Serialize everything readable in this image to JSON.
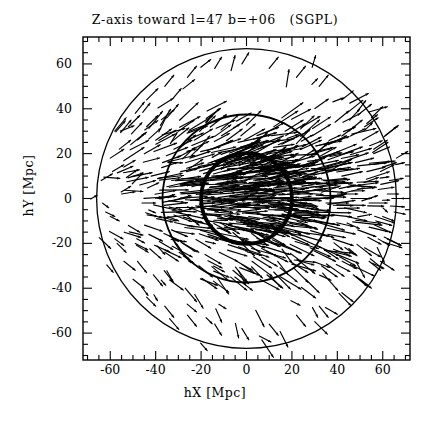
{
  "chart_data": {
    "type": "scatter",
    "title": "Z-axis toward l=47 b=+06   (SGPL)",
    "subtitle": "",
    "xlabel": "hX [Mpc]",
    "ylabel": "hY [Mpc]",
    "xlim": [
      -72,
      72
    ],
    "ylim": [
      -72,
      72
    ],
    "grid": false,
    "legend": null,
    "xticks": [
      -60,
      -40,
      -20,
      0,
      20,
      40,
      60
    ],
    "xticklabels": [
      "-60",
      "-40",
      "-20",
      "0",
      "20",
      "40",
      "60"
    ],
    "yticks": [
      60,
      40,
      20,
      0,
      -20,
      -40,
      -60
    ],
    "yticklabels": [
      "60",
      "40",
      "20",
      "0",
      "-20",
      "-40",
      "-60"
    ],
    "minor_tick_step": 5,
    "annotations": [
      {
        "kind": "circle",
        "center": [
          0,
          0
        ],
        "radius": 20,
        "linewidth": "thick",
        "label": "inner-circle-20Mpc"
      },
      {
        "kind": "circle",
        "center": [
          0,
          0
        ],
        "radius": 37,
        "linewidth": "medium",
        "label": "middle-circle-37Mpc"
      },
      {
        "kind": "circle",
        "center": [
          0,
          0
        ],
        "radius": 66,
        "linewidth": "thin",
        "label": "outer-circle-66Mpc"
      }
    ],
    "vectors": [
      [
        -64,
        8,
        5,
        3
      ],
      [
        -62,
        -6,
        4,
        -2
      ],
      [
        -60,
        18,
        6,
        4
      ],
      [
        -58,
        30,
        5,
        6
      ],
      [
        -57,
        -20,
        4,
        -4
      ],
      [
        -55,
        2,
        6,
        1
      ],
      [
        -54,
        14,
        5,
        3
      ],
      [
        -52,
        -12,
        5,
        -3
      ],
      [
        -51,
        24,
        6,
        5
      ],
      [
        -49,
        38,
        4,
        5
      ],
      [
        -48,
        -28,
        4,
        -5
      ],
      [
        -47,
        6,
        7,
        2
      ],
      [
        -46,
        -2,
        6,
        0
      ],
      [
        -45,
        20,
        7,
        4
      ],
      [
        -44,
        32,
        5,
        5
      ],
      [
        -43,
        -16,
        6,
        -3
      ],
      [
        -42,
        10,
        8,
        2
      ],
      [
        -41,
        -34,
        4,
        -5
      ],
      [
        -40,
        26,
        7,
        5
      ],
      [
        -39,
        0,
        8,
        1
      ],
      [
        -38,
        -8,
        7,
        -2
      ],
      [
        -37,
        16,
        8,
        3
      ],
      [
        -36,
        -24,
        6,
        -4
      ],
      [
        -35,
        36,
        5,
        6
      ],
      [
        -34,
        5,
        9,
        1
      ],
      [
        -33,
        -14,
        7,
        -3
      ],
      [
        -32,
        22,
        8,
        4
      ],
      [
        -31,
        -4,
        8,
        0
      ],
      [
        -30,
        30,
        7,
        5
      ],
      [
        -29,
        12,
        9,
        2
      ],
      [
        -28,
        -20,
        7,
        -4
      ],
      [
        -27,
        -40,
        5,
        -6
      ],
      [
        -26,
        2,
        10,
        1
      ],
      [
        -25,
        18,
        9,
        3
      ],
      [
        -24,
        -10,
        9,
        -2
      ],
      [
        -23,
        26,
        8,
        5
      ],
      [
        -22,
        8,
        10,
        2
      ],
      [
        -21,
        -30,
        6,
        -5
      ],
      [
        -20,
        -2,
        10,
        0
      ],
      [
        -19,
        14,
        10,
        3
      ],
      [
        -18,
        34,
        6,
        6
      ],
      [
        -17,
        -16,
        9,
        -3
      ],
      [
        -16,
        4,
        11,
        1
      ],
      [
        -15,
        22,
        9,
        4
      ],
      [
        -14,
        -6,
        11,
        -1
      ],
      [
        -13,
        10,
        11,
        2
      ],
      [
        -12,
        -24,
        8,
        -4
      ],
      [
        -11,
        28,
        8,
        5
      ],
      [
        -10,
        0,
        12,
        1
      ],
      [
        -9,
        16,
        11,
        3
      ],
      [
        -8,
        -12,
        11,
        -2
      ],
      [
        -7,
        6,
        12,
        1
      ],
      [
        -6,
        -32,
        7,
        -6
      ],
      [
        -5,
        20,
        10,
        4
      ],
      [
        -4,
        -2,
        12,
        0
      ],
      [
        -3,
        11,
        12,
        2
      ],
      [
        -2,
        -18,
        10,
        -4
      ],
      [
        -1,
        26,
        9,
        5
      ],
      [
        0,
        3,
        12,
        1
      ],
      [
        1,
        -8,
        12,
        -2
      ],
      [
        2,
        15,
        11,
        3
      ],
      [
        3,
        -26,
        8,
        -5
      ],
      [
        4,
        8,
        12,
        2
      ],
      [
        5,
        22,
        10,
        4
      ],
      [
        6,
        -14,
        11,
        -3
      ],
      [
        7,
        0,
        12,
        0
      ],
      [
        8,
        12,
        11,
        2
      ],
      [
        9,
        -34,
        7,
        -6
      ],
      [
        10,
        18,
        10,
        3
      ],
      [
        11,
        -4,
        12,
        -1
      ],
      [
        12,
        6,
        12,
        1
      ],
      [
        13,
        -20,
        10,
        -4
      ],
      [
        14,
        24,
        9,
        4
      ],
      [
        15,
        10,
        11,
        2
      ],
      [
        16,
        -10,
        11,
        -2
      ],
      [
        17,
        30,
        8,
        5
      ],
      [
        18,
        2,
        11,
        0
      ],
      [
        19,
        -28,
        8,
        -5
      ],
      [
        20,
        16,
        10,
        3
      ],
      [
        21,
        -6,
        11,
        -1
      ],
      [
        22,
        8,
        11,
        1
      ],
      [
        23,
        -16,
        10,
        -3
      ],
      [
        24,
        22,
        9,
        4
      ],
      [
        25,
        0,
        11,
        0
      ],
      [
        26,
        -36,
        6,
        -6
      ],
      [
        27,
        12,
        10,
        2
      ],
      [
        28,
        -22,
        9,
        -4
      ],
      [
        29,
        28,
        8,
        5
      ],
      [
        30,
        4,
        10,
        1
      ],
      [
        31,
        -10,
        10,
        -2
      ],
      [
        32,
        18,
        9,
        3
      ],
      [
        33,
        -30,
        7,
        -5
      ],
      [
        34,
        8,
        10,
        1
      ],
      [
        35,
        -2,
        10,
        0
      ],
      [
        36,
        24,
        8,
        4
      ],
      [
        37,
        14,
        9,
        2
      ],
      [
        38,
        -18,
        9,
        -3
      ],
      [
        39,
        34,
        6,
        5
      ],
      [
        40,
        2,
        9,
        0
      ],
      [
        41,
        -26,
        7,
        -4
      ],
      [
        42,
        10,
        9,
        2
      ],
      [
        43,
        20,
        8,
        3
      ],
      [
        44,
        -8,
        9,
        -2
      ],
      [
        45,
        30,
        6,
        5
      ],
      [
        46,
        0,
        9,
        0
      ],
      [
        47,
        -34,
        6,
        -5
      ],
      [
        48,
        16,
        8,
        2
      ],
      [
        49,
        -14,
        8,
        -3
      ],
      [
        50,
        6,
        8,
        1
      ],
      [
        51,
        26,
        7,
        4
      ],
      [
        52,
        -22,
        7,
        -4
      ],
      [
        53,
        12,
        8,
        2
      ],
      [
        54,
        -2,
        8,
        0
      ],
      [
        55,
        36,
        5,
        5
      ],
      [
        56,
        20,
        7,
        3
      ],
      [
        57,
        -10,
        7,
        -2
      ],
      [
        58,
        4,
        7,
        1
      ],
      [
        59,
        -28,
        6,
        -4
      ],
      [
        60,
        14,
        6,
        2
      ],
      [
        61,
        28,
        5,
        4
      ],
      [
        62,
        -18,
        6,
        -3
      ],
      [
        63,
        8,
        6,
        1
      ],
      [
        64,
        0,
        6,
        0
      ],
      [
        65,
        -6,
        5,
        -1
      ],
      [
        66,
        18,
        5,
        3
      ],
      [
        -44,
        -44,
        4,
        -4
      ],
      [
        -36,
        -48,
        4,
        -5
      ],
      [
        -26,
        -52,
        4,
        -5
      ],
      [
        -14,
        -56,
        3,
        -5
      ],
      [
        -2,
        -58,
        3,
        -5
      ],
      [
        10,
        -56,
        4,
        -5
      ],
      [
        22,
        -52,
        4,
        -5
      ],
      [
        32,
        -48,
        4,
        -5
      ],
      [
        42,
        -42,
        5,
        -4
      ],
      [
        50,
        -36,
        5,
        -4
      ],
      [
        -50,
        -36,
        5,
        -4
      ],
      [
        -54,
        -28,
        5,
        -4
      ],
      [
        -58,
        -18,
        4,
        -3
      ],
      [
        -60,
        -8,
        4,
        -2
      ],
      [
        54,
        -28,
        5,
        -4
      ],
      [
        58,
        -18,
        5,
        -3
      ],
      [
        60,
        -8,
        5,
        -2
      ],
      [
        62,
        2,
        5,
        0
      ],
      [
        -44,
        44,
        5,
        5
      ],
      [
        -36,
        50,
        4,
        5
      ],
      [
        -26,
        54,
        4,
        5
      ],
      [
        -14,
        58,
        3,
        5
      ],
      [
        -2,
        60,
        3,
        5
      ],
      [
        10,
        58,
        4,
        5
      ],
      [
        22,
        54,
        4,
        5
      ],
      [
        32,
        50,
        4,
        5
      ],
      [
        42,
        44,
        5,
        4
      ],
      [
        50,
        38,
        5,
        4
      ],
      [
        -52,
        32,
        5,
        5
      ],
      [
        -56,
        22,
        5,
        4
      ],
      [
        -59,
        12,
        5,
        3
      ],
      [
        52,
        32,
        6,
        4
      ],
      [
        56,
        22,
        6,
        4
      ],
      [
        59,
        12,
        6,
        3
      ]
    ]
  }
}
